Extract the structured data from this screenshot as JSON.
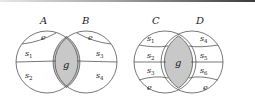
{
  "diagrams": [
    {
      "name": "left",
      "sets": [
        {
          "label": "A"
        },
        {
          "label": "B"
        }
      ],
      "intersection_label": "g",
      "left_regions": [
        "e",
        "s1",
        "s2"
      ],
      "right_regions": [
        "e",
        "s3",
        "s4"
      ]
    },
    {
      "name": "right",
      "sets": [
        {
          "label": "C"
        },
        {
          "label": "D"
        }
      ],
      "intersection_label": "g",
      "left_regions": [
        "s1",
        "s2",
        "s3",
        "e"
      ],
      "right_regions": [
        "s4",
        "s5",
        "s6",
        "e"
      ]
    }
  ],
  "colors": {
    "shade": "#c8c8c8",
    "stroke": "#555555"
  }
}
